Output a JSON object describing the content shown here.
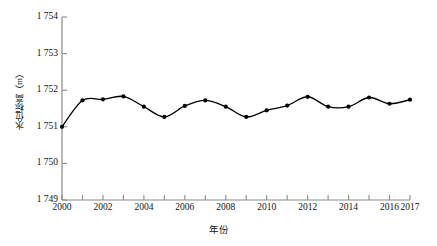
{
  "chart_data": {
    "type": "line",
    "title": "",
    "xlabel": "年份",
    "ylabel": "水位标高（m）",
    "x": [
      2000,
      2001,
      2002,
      2003,
      2004,
      2005,
      2006,
      2007,
      2008,
      2009,
      2010,
      2011,
      2012,
      2013,
      2014,
      2015,
      2016,
      2017
    ],
    "values": [
      1751.0,
      1751.72,
      1751.75,
      1751.83,
      1751.55,
      1751.27,
      1751.57,
      1751.72,
      1751.55,
      1751.27,
      1751.45,
      1751.58,
      1751.82,
      1751.55,
      1751.55,
      1751.8,
      1751.63,
      1751.74
    ],
    "series": [
      {
        "name": "水位标高",
        "values": [
          1751.0,
          1751.72,
          1751.75,
          1751.83,
          1751.55,
          1751.27,
          1751.57,
          1751.72,
          1751.55,
          1751.27,
          1751.45,
          1751.58,
          1751.82,
          1751.55,
          1751.55,
          1751.8,
          1751.63,
          1751.74
        ]
      }
    ],
    "xlim": [
      2000,
      2017
    ],
    "ylim": [
      1749,
      1754
    ],
    "ytick_values": [
      1754,
      1753,
      1752,
      1751,
      1750,
      1749
    ],
    "ytick_labels": [
      "1 754",
      "1 753",
      "1 752",
      "1 751",
      "1 750",
      "1 749"
    ],
    "xtick_values": [
      2000,
      2002,
      2004,
      2006,
      2008,
      2010,
      2012,
      2014,
      2016,
      2017
    ],
    "xtick_labels": [
      "2000",
      "2002",
      "2004",
      "2006",
      "2008",
      "2010",
      "2012",
      "2014",
      "2016",
      "2017"
    ],
    "xtick_minor_values": [
      2000,
      2001,
      2002,
      2003,
      2004,
      2005,
      2006,
      2007,
      2008,
      2009,
      2010,
      2011,
      2012,
      2013,
      2014,
      2015,
      2016,
      2017
    ],
    "grid": false,
    "legend": "none",
    "line_color": "#000000",
    "marker_color": "#000000",
    "marker": "circle",
    "axis_color": "#808080",
    "background": "#ffffff"
  }
}
